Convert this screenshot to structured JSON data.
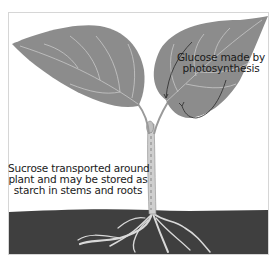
{
  "diagram": {
    "type": "plant-transport-illustration",
    "labels": {
      "glucose_line1": "Glucose made by",
      "glucose_line2": "photosynthesis",
      "sucrose_line1": "Sucrose transported around",
      "sucrose_line2": "plant and may be stored as",
      "sucrose_line3": "starch in stems and roots"
    },
    "colors": {
      "leaf": "#8c8c8c",
      "vein": "#c8c8c8",
      "soil": "#3f3f3f",
      "root": "#d9d9d9",
      "stem": "#cfcfcf",
      "arrow": "#333333",
      "background": "#ffffff"
    }
  }
}
